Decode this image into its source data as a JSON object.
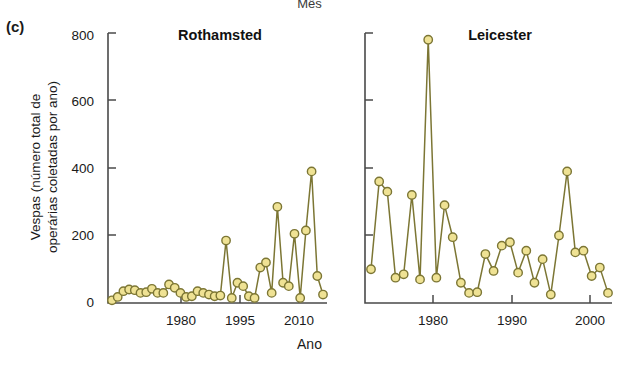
{
  "figure": {
    "panel_label": "(c)",
    "clipped_top_label": "Mês",
    "ylabel": "Vespas (número total de\noperárias coletadas por ano)",
    "xlabel": "Ano",
    "marker_fill": "#efe294",
    "marker_stroke": "#7c7634",
    "line_color": "#7c7634",
    "axis_color": "#4a4a4a"
  },
  "chart_data": [
    {
      "type": "line",
      "title": "Rothamsted",
      "xlabel": "Ano",
      "ylabel": "Vespas (número total de operárias coletadas por ano)",
      "xlim": [
        1975,
        2011
      ],
      "ylim": [
        0,
        800
      ],
      "yticks": [
        0,
        200,
        400,
        600,
        800
      ],
      "xticks": [
        1980,
        1995,
        2010
      ],
      "grid": false,
      "legend": "none",
      "x": [
        1976,
        1977,
        1978,
        1979,
        1980,
        1981,
        1982,
        1983,
        1984,
        1985,
        1986,
        1987,
        1988,
        1989,
        1990,
        1991,
        1992,
        1993,
        1994,
        1995,
        1996,
        1997,
        1998,
        1999,
        2000,
        2001,
        2002,
        2003,
        2004,
        2005,
        2006,
        2007,
        2008,
        2009,
        2010
      ],
      "values": [
        8,
        18,
        35,
        40,
        38,
        30,
        32,
        42,
        30,
        30,
        55,
        45,
        30,
        18,
        20,
        35,
        30,
        25,
        20,
        22,
        185,
        15,
        60,
        50,
        20,
        15,
        105,
        120,
        30,
        285,
        60,
        50,
        205,
        15,
        215,
        390,
        80,
        25
      ]
    },
    {
      "type": "line",
      "title": "Leicester",
      "xlabel": "Ano",
      "ylabel": "Vespas (número total de operárias coletadas por ano)",
      "xlim": [
        1971,
        2002
      ],
      "ylim": [
        0,
        800
      ],
      "yticks": [
        0,
        200,
        400,
        600,
        800
      ],
      "xticks": [
        1980,
        1990,
        2000
      ],
      "grid": false,
      "legend": "none",
      "x": [
        1972,
        1973,
        1974,
        1975,
        1976,
        1977,
        1978,
        1979,
        1980,
        1981,
        1982,
        1983,
        1984,
        1985,
        1986,
        1987,
        1988,
        1989,
        1990,
        1991,
        1992,
        1993,
        1994,
        1995,
        1996,
        1997,
        1998,
        1999,
        2000,
        2001
      ],
      "values": [
        100,
        360,
        330,
        75,
        85,
        320,
        70,
        780,
        75,
        290,
        195,
        60,
        30,
        32,
        145,
        95,
        170,
        180,
        90,
        155,
        60,
        130,
        25,
        200,
        390,
        150,
        155,
        80,
        105,
        30
      ]
    }
  ]
}
